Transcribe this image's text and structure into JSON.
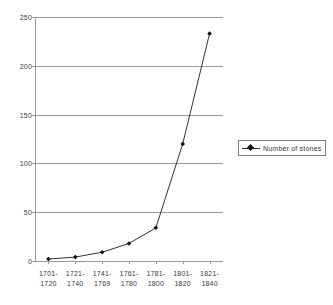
{
  "chart_data": {
    "type": "line",
    "title": "",
    "subtitle": "",
    "xlabel": "",
    "ylabel": "",
    "categories": [
      "1701-\n1720",
      "1721-\n1740",
      "1741-\n1769",
      "1761-\n1780",
      "1781-\n1800",
      "1801-\n1820",
      "1821-\n1840"
    ],
    "category_lines": [
      [
        "1701-",
        "1720"
      ],
      [
        "1721-",
        "1740"
      ],
      [
        "1741-",
        "1769"
      ],
      [
        "1761-",
        "1780"
      ],
      [
        "1781-",
        "1800"
      ],
      [
        "1801-",
        "1820"
      ],
      [
        "1821-",
        "1840"
      ]
    ],
    "series": [
      {
        "name": "Number of stones",
        "values": [
          2,
          4,
          9,
          18,
          34,
          120,
          233
        ]
      }
    ],
    "ylim": [
      0,
      250
    ],
    "yticks": [
      0,
      50,
      100,
      150,
      200,
      250
    ],
    "ytick_labels": [
      "0",
      "50",
      "100",
      "150",
      "200",
      "250"
    ],
    "grid": true,
    "grid_axis": "y",
    "legend_position": "right",
    "legend_entries": [
      "Number of stones"
    ],
    "marker": "diamond",
    "line_color": "#333333",
    "marker_color": "#111111",
    "grid_color": "#9a9a9a",
    "text_color": "#3a3a3a",
    "background": "#ffffff"
  }
}
